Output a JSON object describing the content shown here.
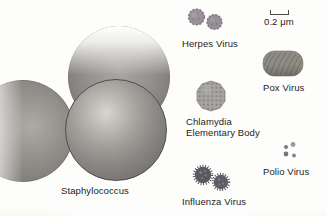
{
  "figure_type": "size-comparison diagram of microorganisms",
  "labels": {
    "staphylococcus": "Staphylococcus",
    "herpes": "Herpes Virus",
    "pox": "Pox Virus",
    "chlamydia_line1": "Chlamydia",
    "chlamydia_line2": "Elementary Body",
    "polio": "Polio Virus",
    "influenza": "Influenza Virus",
    "scale": "0.2 μm"
  },
  "colors": {
    "background": "#fdfdfb",
    "text": "#1e1e1e",
    "sphere_highlight": "#d9d6d1",
    "sphere_mid": "#969390",
    "sphere_dark": "#656260",
    "herpes_particle": "#9a929a",
    "pox_particle": "#8f8b85",
    "chlamydia_particle": "#a8a5a1",
    "influenza_particle": "#5c5861",
    "polio_particle": "#85838a",
    "scalebar": "#4a4a4a"
  }
}
